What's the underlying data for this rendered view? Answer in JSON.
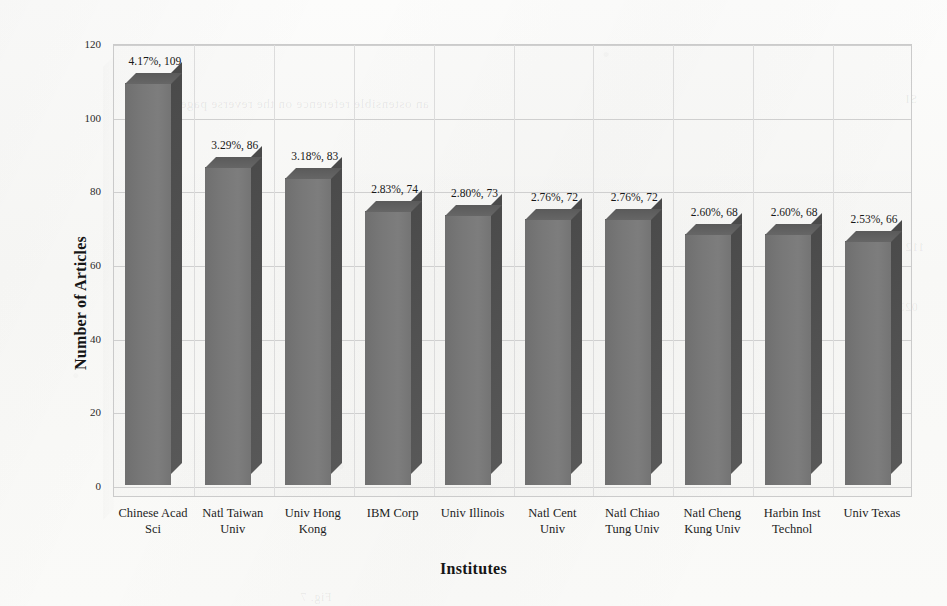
{
  "chart_data": {
    "type": "bar",
    "title": "",
    "xlabel": "Institutes",
    "ylabel": "Number of Articles",
    "ylim": [
      0,
      120
    ],
    "ytick_step": 20,
    "yticks": [
      "0",
      "20",
      "40",
      "60",
      "80",
      "100",
      "120"
    ],
    "grid": true,
    "legend": "none",
    "style_3d": true,
    "categories": [
      "Chinese Acad\nSci",
      "Natl Taiwan\nUniv",
      "Univ Hong\nKong",
      "IBM Corp",
      "Univ Illinois",
      "Natl Cent\nUniv",
      "Natl Chiao\nTung Univ",
      "Natl Cheng\nKung Univ",
      "Harbin Inst\nTechnol",
      "Univ Texas"
    ],
    "values": [
      109,
      86,
      83,
      74,
      73,
      72,
      72,
      68,
      68,
      66
    ],
    "percentages": [
      "4.17%",
      "3.29%",
      "3.18%",
      "2.83%",
      "2.80%",
      "2.76%",
      "2.76%",
      "2.60%",
      "2.60%",
      "2.53%"
    ],
    "data_labels": [
      "4.17%, 109",
      "3.29%, 86",
      "3.18%, 83",
      "2.83%, 74",
      "2.80%, 73",
      "2.76%, 72",
      "2.76%, 72",
      "2.60%, 68",
      "2.60%, 68",
      "2.53%, 66"
    ],
    "bar_color": "#787878",
    "bar_side_color": "#4f4f4f",
    "bar_top_color": "#5f5f5f",
    "grid_color": "#cfcfcf",
    "background_color": "#fbfbfa"
  },
  "ghost": {
    "top": "an ostensible reference on the reverse page",
    "right1": "SI",
    "right2": "112",
    "right3": "023",
    "bottom": "Fig. 7"
  }
}
